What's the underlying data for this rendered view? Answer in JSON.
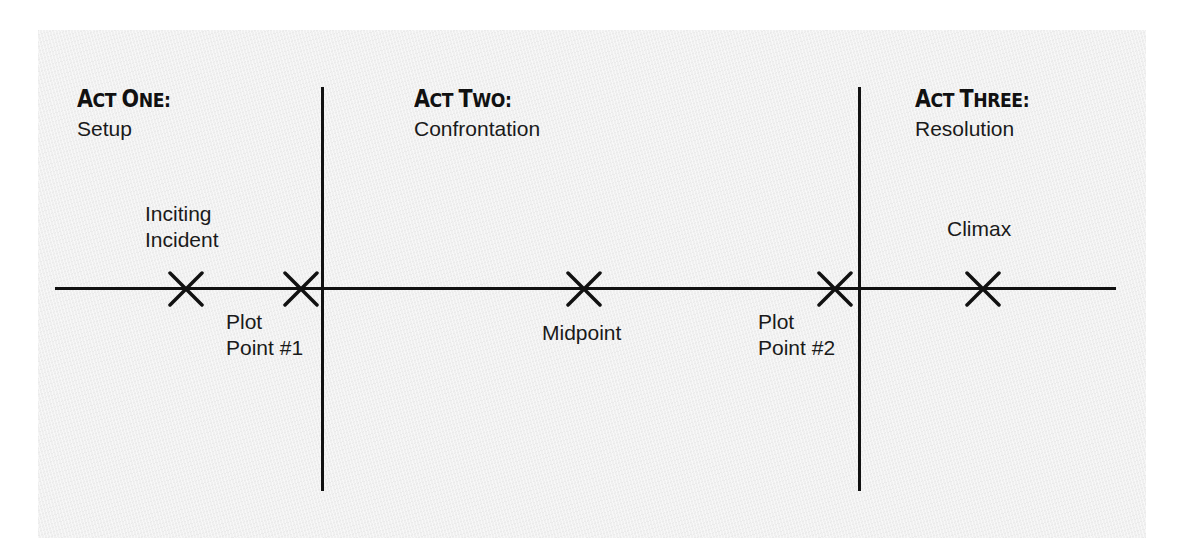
{
  "diagram": {
    "acts": [
      {
        "title_initial": "A",
        "title_rest": "CT ",
        "title_initial2": "O",
        "title_rest2": "NE:",
        "heading": "Act One:",
        "subtitle": "Setup"
      },
      {
        "title_initial": "A",
        "title_rest": "CT ",
        "title_initial2": "T",
        "title_rest2": "WO:",
        "heading": "Act Two:",
        "subtitle": "Confrontation"
      },
      {
        "title_initial": "A",
        "title_rest": "CT ",
        "title_initial2": "T",
        "title_rest2": "HREE:",
        "heading": "Act Three:",
        "subtitle": "Resolution"
      }
    ],
    "events": [
      {
        "line1": "Inciting",
        "line2": "Incident",
        "position": "above",
        "act": "Act One"
      },
      {
        "line1": "Plot",
        "line2": "Point #1",
        "position": "below",
        "act": "Act One"
      },
      {
        "line1": "Midpoint",
        "line2": "",
        "position": "below",
        "act": "Act Two"
      },
      {
        "line1": "Plot",
        "line2": "Point #2",
        "position": "below",
        "act": "Act Two"
      },
      {
        "line1": "Climax",
        "line2": "",
        "position": "above",
        "act": "Act Three"
      }
    ],
    "marker_icon": "x-mark",
    "colors": {
      "ink": "#111111",
      "paper": "#f0f0f0",
      "background": "#ffffff"
    }
  }
}
